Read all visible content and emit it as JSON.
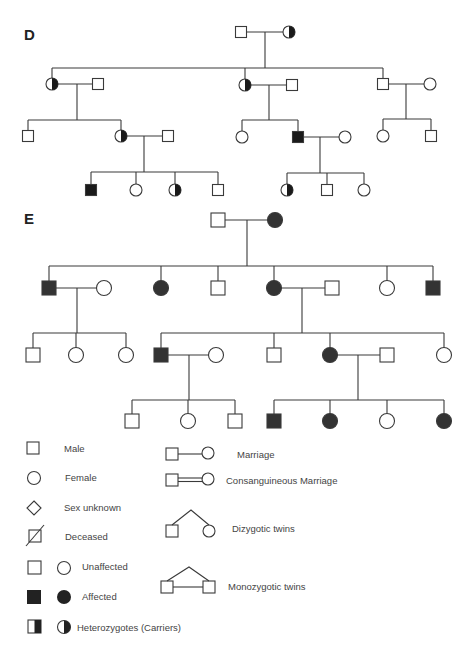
{
  "colors": {
    "line": "#3a3a3a",
    "affected_d": "#1a1a1a",
    "affected_e": "#333333",
    "unaffected": "#ffffff",
    "text": "#444444"
  },
  "pedigrees": [
    {
      "id": "D",
      "label": "D",
      "label_pos": [
        24,
        40
      ],
      "size": 11,
      "individuals": [
        {
          "id": "D-I-1",
          "sex": "male",
          "status": "unaffected",
          "x": 241,
          "y": 32
        },
        {
          "id": "D-I-2",
          "sex": "female",
          "status": "carrier",
          "x": 289,
          "y": 32
        },
        {
          "id": "D-II-1",
          "sex": "female",
          "status": "carrier",
          "x": 52,
          "y": 84
        },
        {
          "id": "D-II-1s",
          "sex": "male",
          "status": "unaffected",
          "x": 98,
          "y": 84
        },
        {
          "id": "D-II-2",
          "sex": "female",
          "status": "carrier",
          "x": 245,
          "y": 85
        },
        {
          "id": "D-II-2s",
          "sex": "male",
          "status": "unaffected",
          "x": 292,
          "y": 85
        },
        {
          "id": "D-II-3",
          "sex": "male",
          "status": "unaffected",
          "x": 383,
          "y": 84
        },
        {
          "id": "D-II-3s",
          "sex": "female",
          "status": "unaffected",
          "x": 430,
          "y": 84
        },
        {
          "id": "D-III-1",
          "sex": "male",
          "status": "unaffected",
          "x": 28,
          "y": 136
        },
        {
          "id": "D-III-2",
          "sex": "female",
          "status": "carrier",
          "x": 121,
          "y": 136
        },
        {
          "id": "D-III-2s",
          "sex": "male",
          "status": "unaffected",
          "x": 168,
          "y": 136
        },
        {
          "id": "D-III-3",
          "sex": "female",
          "status": "unaffected",
          "x": 242,
          "y": 137
        },
        {
          "id": "D-III-4",
          "sex": "male",
          "status": "affected",
          "x": 298,
          "y": 137
        },
        {
          "id": "D-III-4s",
          "sex": "female",
          "status": "unaffected",
          "x": 345,
          "y": 137
        },
        {
          "id": "D-III-5",
          "sex": "female",
          "status": "unaffected",
          "x": 383,
          "y": 136
        },
        {
          "id": "D-III-6",
          "sex": "male",
          "status": "unaffected",
          "x": 431,
          "y": 136
        },
        {
          "id": "D-IV-1",
          "sex": "male",
          "status": "affected",
          "x": 91,
          "y": 190
        },
        {
          "id": "D-IV-2",
          "sex": "female",
          "status": "unaffected",
          "x": 136,
          "y": 190
        },
        {
          "id": "D-IV-3",
          "sex": "female",
          "status": "carrier",
          "x": 175,
          "y": 190
        },
        {
          "id": "D-IV-4",
          "sex": "male",
          "status": "unaffected",
          "x": 218,
          "y": 190
        },
        {
          "id": "D-IV-5",
          "sex": "female",
          "status": "carrier",
          "x": 287,
          "y": 190
        },
        {
          "id": "D-IV-6",
          "sex": "male",
          "status": "unaffected",
          "x": 327,
          "y": 190
        },
        {
          "id": "D-IV-7",
          "sex": "female",
          "status": "unaffected",
          "x": 364,
          "y": 190
        }
      ],
      "lines": [
        [
          [
            246,
            32
          ],
          [
            284,
            32
          ]
        ],
        [
          [
            265,
            32
          ],
          [
            265,
            68
          ]
        ],
        [
          [
            52,
            68
          ],
          [
            383,
            68
          ]
        ],
        [
          [
            52,
            68
          ],
          [
            52,
            79
          ]
        ],
        [
          [
            245,
            68
          ],
          [
            245,
            80
          ]
        ],
        [
          [
            383,
            68
          ],
          [
            383,
            79
          ]
        ],
        [
          [
            57,
            84
          ],
          [
            93,
            84
          ]
        ],
        [
          [
            77,
            84
          ],
          [
            77,
            120
          ]
        ],
        [
          [
            28,
            120
          ],
          [
            121,
            120
          ]
        ],
        [
          [
            28,
            120
          ],
          [
            28,
            131
          ]
        ],
        [
          [
            121,
            120
          ],
          [
            121,
            131
          ]
        ],
        [
          [
            250,
            85
          ],
          [
            287,
            85
          ]
        ],
        [
          [
            269,
            85
          ],
          [
            269,
            120
          ]
        ],
        [
          [
            242,
            120
          ],
          [
            298,
            120
          ]
        ],
        [
          [
            242,
            120
          ],
          [
            242,
            132
          ]
        ],
        [
          [
            298,
            120
          ],
          [
            298,
            132
          ]
        ],
        [
          [
            388,
            84
          ],
          [
            425,
            84
          ]
        ],
        [
          [
            406,
            84
          ],
          [
            406,
            119
          ]
        ],
        [
          [
            383,
            119
          ],
          [
            431,
            119
          ]
        ],
        [
          [
            383,
            119
          ],
          [
            383,
            131
          ]
        ],
        [
          [
            431,
            119
          ],
          [
            431,
            131
          ]
        ],
        [
          [
            126,
            136
          ],
          [
            163,
            136
          ]
        ],
        [
          [
            144,
            136
          ],
          [
            144,
            172
          ]
        ],
        [
          [
            91,
            172
          ],
          [
            218,
            172
          ]
        ],
        [
          [
            91,
            172
          ],
          [
            91,
            185
          ]
        ],
        [
          [
            136,
            172
          ],
          [
            136,
            185
          ]
        ],
        [
          [
            175,
            172
          ],
          [
            175,
            185
          ]
        ],
        [
          [
            218,
            172
          ],
          [
            218,
            185
          ]
        ],
        [
          [
            303,
            137
          ],
          [
            340,
            137
          ]
        ],
        [
          [
            320,
            137
          ],
          [
            320,
            173
          ]
        ],
        [
          [
            287,
            173
          ],
          [
            364,
            173
          ]
        ],
        [
          [
            287,
            173
          ],
          [
            287,
            185
          ]
        ],
        [
          [
            327,
            173
          ],
          [
            327,
            185
          ]
        ],
        [
          [
            364,
            173
          ],
          [
            364,
            185
          ]
        ]
      ]
    },
    {
      "id": "E",
      "label": "E",
      "label_pos": [
        24,
        224
      ],
      "size": 14,
      "individuals": [
        {
          "id": "E-I-1",
          "sex": "male",
          "status": "unaffected",
          "x": 218,
          "y": 220
        },
        {
          "id": "E-I-2",
          "sex": "female",
          "status": "affected",
          "x": 275,
          "y": 220
        },
        {
          "id": "E-II-1",
          "sex": "male",
          "status": "affected",
          "x": 49,
          "y": 288
        },
        {
          "id": "E-II-1s",
          "sex": "female",
          "status": "unaffected",
          "x": 104,
          "y": 288
        },
        {
          "id": "E-II-2",
          "sex": "female",
          "status": "affected",
          "x": 161,
          "y": 288
        },
        {
          "id": "E-II-3",
          "sex": "male",
          "status": "unaffected",
          "x": 218,
          "y": 288
        },
        {
          "id": "E-II-4",
          "sex": "female",
          "status": "affected",
          "x": 274,
          "y": 288
        },
        {
          "id": "E-II-4s",
          "sex": "male",
          "status": "unaffected",
          "x": 332,
          "y": 288
        },
        {
          "id": "E-II-5",
          "sex": "female",
          "status": "unaffected",
          "x": 387,
          "y": 288
        },
        {
          "id": "E-II-6",
          "sex": "male",
          "status": "affected",
          "x": 433,
          "y": 288
        },
        {
          "id": "E-III-1",
          "sex": "male",
          "status": "unaffected",
          "x": 33,
          "y": 355
        },
        {
          "id": "E-III-2",
          "sex": "female",
          "status": "unaffected",
          "x": 76,
          "y": 355
        },
        {
          "id": "E-III-3",
          "sex": "female",
          "status": "unaffected",
          "x": 126,
          "y": 355
        },
        {
          "id": "E-III-4",
          "sex": "male",
          "status": "affected",
          "x": 161,
          "y": 355
        },
        {
          "id": "E-III-4s",
          "sex": "female",
          "status": "unaffected",
          "x": 216,
          "y": 355
        },
        {
          "id": "E-III-5",
          "sex": "male",
          "status": "unaffected",
          "x": 274,
          "y": 355
        },
        {
          "id": "E-III-6",
          "sex": "female",
          "status": "affected",
          "x": 330,
          "y": 355
        },
        {
          "id": "E-III-6s",
          "sex": "male",
          "status": "unaffected",
          "x": 387,
          "y": 355
        },
        {
          "id": "E-III-7",
          "sex": "female",
          "status": "unaffected",
          "x": 444,
          "y": 355
        },
        {
          "id": "E-IV-1",
          "sex": "male",
          "status": "unaffected",
          "x": 132,
          "y": 421
        },
        {
          "id": "E-IV-2",
          "sex": "female",
          "status": "unaffected",
          "x": 188,
          "y": 421
        },
        {
          "id": "E-IV-3",
          "sex": "male",
          "status": "unaffected",
          "x": 235,
          "y": 421
        },
        {
          "id": "E-IV-4",
          "sex": "male",
          "status": "affected",
          "x": 274,
          "y": 421
        },
        {
          "id": "E-IV-5",
          "sex": "female",
          "status": "affected",
          "x": 330,
          "y": 421
        },
        {
          "id": "E-IV-6",
          "sex": "female",
          "status": "unaffected",
          "x": 387,
          "y": 421
        },
        {
          "id": "E-IV-7",
          "sex": "female",
          "status": "affected",
          "x": 444,
          "y": 421
        }
      ],
      "lines": [
        [
          [
            225,
            220
          ],
          [
            268,
            220
          ]
        ],
        [
          [
            247,
            220
          ],
          [
            247,
            266
          ]
        ],
        [
          [
            49,
            266
          ],
          [
            433,
            266
          ]
        ],
        [
          [
            49,
            266
          ],
          [
            49,
            281
          ]
        ],
        [
          [
            161,
            266
          ],
          [
            161,
            281
          ]
        ],
        [
          [
            218,
            266
          ],
          [
            218,
            281
          ]
        ],
        [
          [
            274,
            266
          ],
          [
            274,
            281
          ]
        ],
        [
          [
            387,
            266
          ],
          [
            387,
            281
          ]
        ],
        [
          [
            433,
            266
          ],
          [
            433,
            281
          ]
        ],
        [
          [
            56,
            288
          ],
          [
            97,
            288
          ]
        ],
        [
          [
            77,
            288
          ],
          [
            77,
            333
          ]
        ],
        [
          [
            33,
            333
          ],
          [
            126,
            333
          ]
        ],
        [
          [
            33,
            333
          ],
          [
            33,
            348
          ]
        ],
        [
          [
            76,
            333
          ],
          [
            76,
            348
          ]
        ],
        [
          [
            126,
            333
          ],
          [
            126,
            348
          ]
        ],
        [
          [
            281,
            288
          ],
          [
            325,
            288
          ]
        ],
        [
          [
            302,
            288
          ],
          [
            302,
            333
          ]
        ],
        [
          [
            161,
            333
          ],
          [
            444,
            333
          ]
        ],
        [
          [
            161,
            333
          ],
          [
            161,
            348
          ]
        ],
        [
          [
            274,
            333
          ],
          [
            274,
            348
          ]
        ],
        [
          [
            330,
            333
          ],
          [
            330,
            348
          ]
        ],
        [
          [
            444,
            333
          ],
          [
            444,
            348
          ]
        ],
        [
          [
            168,
            355
          ],
          [
            209,
            355
          ]
        ],
        [
          [
            189,
            355
          ],
          [
            189,
            400
          ]
        ],
        [
          [
            132,
            400
          ],
          [
            235,
            400
          ]
        ],
        [
          [
            132,
            400
          ],
          [
            132,
            414
          ]
        ],
        [
          [
            188,
            400
          ],
          [
            188,
            414
          ]
        ],
        [
          [
            235,
            400
          ],
          [
            235,
            414
          ]
        ],
        [
          [
            337,
            355
          ],
          [
            380,
            355
          ]
        ],
        [
          [
            358,
            355
          ],
          [
            358,
            400
          ]
        ],
        [
          [
            274,
            400
          ],
          [
            444,
            400
          ]
        ],
        [
          [
            274,
            400
          ],
          [
            274,
            414
          ]
        ],
        [
          [
            330,
            400
          ],
          [
            330,
            414
          ]
        ],
        [
          [
            387,
            400
          ],
          [
            387,
            414
          ]
        ],
        [
          [
            444,
            400
          ],
          [
            444,
            414
          ]
        ]
      ]
    }
  ],
  "legend": {
    "left": [
      {
        "key": "male",
        "label": "Male",
        "text_x": 64,
        "y": 449
      },
      {
        "key": "female",
        "label": "Female",
        "text_x": 65,
        "y": 478
      },
      {
        "key": "sex_unknown",
        "label": "Sex unknown",
        "text_x": 64,
        "y": 508
      },
      {
        "key": "deceased",
        "label": "Deceased",
        "text_x": 65,
        "y": 537
      },
      {
        "key": "unaffected",
        "label": "Unaffected",
        "text_x": 82,
        "y": 567
      },
      {
        "key": "affected",
        "label": "Affected",
        "text_x": 82,
        "y": 597
      },
      {
        "key": "carrier",
        "label": "Heterozygotes (Carriers)",
        "text_x": 77,
        "y": 628
      }
    ],
    "right": [
      {
        "key": "marriage",
        "label": "Marriage",
        "text_x": 237,
        "y": 455
      },
      {
        "key": "consanguineous",
        "label": "Consanguineous Marriage",
        "text_x": 226,
        "y": 481
      },
      {
        "key": "dizygotic",
        "label": "Dizygotic twins",
        "text_x": 232,
        "y": 529
      },
      {
        "key": "monozygotic",
        "label": "Monozygotic twins",
        "text_x": 228,
        "y": 587
      }
    ]
  }
}
